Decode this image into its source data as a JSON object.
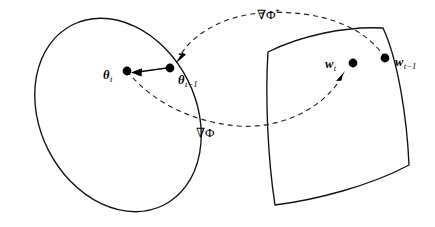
{
  "figure": {
    "name": "mirror-descent-duality-diagram",
    "background_color": "#ffffff",
    "stroke_color": "#111111",
    "dashed_stroke_color": "#222222",
    "width": 435,
    "height": 227
  },
  "labels": {
    "theta_t": {
      "base": "θ",
      "sub": "t"
    },
    "theta_t_minus_1": {
      "base": "θ",
      "sub": "t−1"
    },
    "w_t": {
      "base": "w",
      "sub": "t"
    },
    "w_t_minus_1": {
      "base": "w",
      "sub": "t−1"
    },
    "grad_phi_star": {
      "base": "∇Φ",
      "sup": "*"
    },
    "grad_phi": {
      "base": "∇Φ"
    }
  },
  "regions": [
    {
      "id": "primal-region",
      "shape": "tilted-ellipse",
      "center": [
        118,
        115
      ],
      "rx": 78,
      "ry": 101,
      "rotation_deg": -27
    },
    {
      "id": "dual-region",
      "shape": "rounded-convex-quadrilateral",
      "corners": [
        [
          268,
          52
        ],
        [
          383,
          28
        ],
        [
          409,
          165
        ],
        [
          275,
          205
        ]
      ]
    }
  ],
  "points": [
    {
      "id": "theta-t-dot",
      "x": 127,
      "y": 71,
      "r": 4.4,
      "label": "theta_t"
    },
    {
      "id": "theta-t-minus-1-dot",
      "x": 170,
      "y": 68,
      "r": 4.4,
      "label": "theta_t_minus_1"
    },
    {
      "id": "w-t-dot",
      "x": 353,
      "y": 63,
      "r": 4.4,
      "label": "w_t"
    },
    {
      "id": "w-t-minus-1-dot",
      "x": 385,
      "y": 58,
      "r": 4.4,
      "label": "w_t_minus_1"
    }
  ],
  "connectors": [
    {
      "id": "update-arrow",
      "style": "solid",
      "from": "theta-t-minus-1-dot",
      "to": "theta-t-dot",
      "direction": "left"
    },
    {
      "id": "grad-phi-star-curve",
      "style": "dashed",
      "from": "w-t-minus-1-dot",
      "to": "theta-t-minus-1-dot",
      "label": "grad_phi_star",
      "arc": "upper"
    },
    {
      "id": "grad-phi-curve",
      "style": "dashed",
      "from": "theta-t-dot",
      "to": "w-t-dot",
      "label": "grad_phi",
      "arc": "lower"
    }
  ]
}
